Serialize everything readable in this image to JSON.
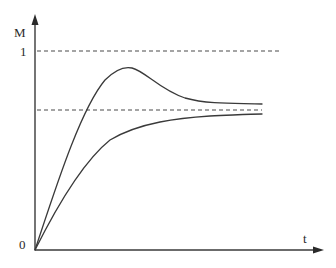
{
  "diagram": {
    "type": "step-response",
    "axes": {
      "y_label": "M",
      "x_label": "t",
      "origin_label": "0",
      "y_tick_label": "1"
    },
    "reference_lines": [
      {
        "name": "unit-level",
        "label": "1",
        "style": "dashed"
      },
      {
        "name": "steady-state-level",
        "label": "",
        "style": "dashed"
      }
    ],
    "curves": [
      {
        "name": "overshoot-response",
        "description": "rises, overshoots, settles to steady state"
      },
      {
        "name": "monotonic-response",
        "description": "rises monotonically toward steady state"
      }
    ],
    "colors": {
      "stroke": "#3a3a3a",
      "background": "#ffffff"
    }
  }
}
